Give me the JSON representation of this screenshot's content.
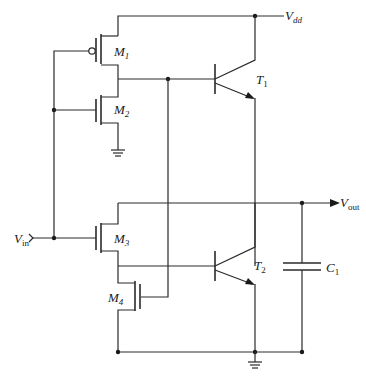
{
  "diagram": {
    "type": "circuit-schematic",
    "background": "#ffffff",
    "line_color": "#2a2a2a"
  },
  "labels": {
    "vdd": {
      "main": "V",
      "sub": "dd"
    },
    "vout": {
      "main": "V",
      "sub": "out"
    },
    "vin": {
      "main": "V",
      "sub": "in"
    },
    "m1": {
      "main": "M",
      "sub": "1"
    },
    "m2": {
      "main": "M",
      "sub": "2"
    },
    "m3": {
      "main": "M",
      "sub": "3"
    },
    "m4": {
      "main": "M",
      "sub": "4"
    },
    "t1": {
      "main": "T",
      "sub": "1"
    },
    "t2": {
      "main": "T",
      "sub": "2"
    },
    "c1": {
      "main": "C",
      "sub": "1"
    }
  },
  "components": [
    {
      "id": "M1",
      "kind": "PMOS transistor"
    },
    {
      "id": "M2",
      "kind": "NMOS transistor"
    },
    {
      "id": "M3",
      "kind": "NMOS transistor"
    },
    {
      "id": "M4",
      "kind": "NMOS transistor"
    },
    {
      "id": "T1",
      "kind": "NPN bipolar transistor"
    },
    {
      "id": "T2",
      "kind": "NPN bipolar transistor"
    },
    {
      "id": "C1",
      "kind": "capacitor"
    }
  ],
  "nets": {
    "supply": "Vdd",
    "input": "Vin",
    "output": "Vout",
    "ground_symbols": 2
  }
}
